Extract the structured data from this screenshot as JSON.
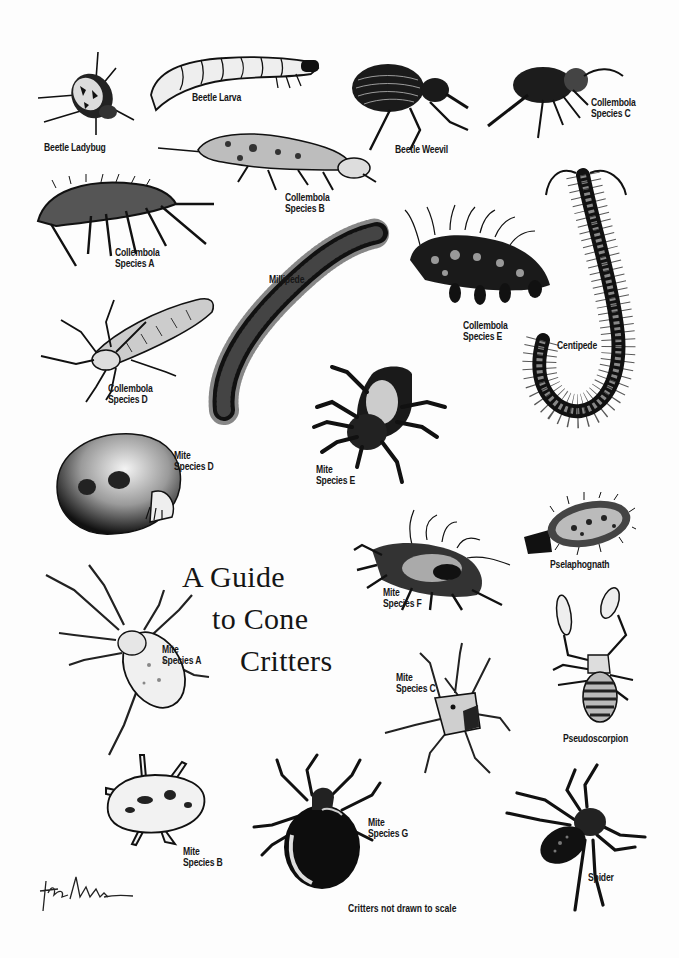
{
  "poster": {
    "title_lines": [
      "A Guide",
      "to Cone",
      "Critters"
    ],
    "footnote": "Critters not drawn to scale",
    "signature_icon": "artist-signature-icon",
    "colors": {
      "ink": "#111111",
      "paper": "#fdfdfd"
    }
  },
  "critters": [
    {
      "id": "beetle-ladybug",
      "label": [
        "Beetle Ladybug"
      ]
    },
    {
      "id": "beetle-larva",
      "label": [
        "Beetle Larva"
      ]
    },
    {
      "id": "beetle-weevil",
      "label": [
        "Beetle Weevil"
      ]
    },
    {
      "id": "collembola-c",
      "label": [
        "Collembola",
        "Species C"
      ]
    },
    {
      "id": "collembola-b",
      "label": [
        "Collembola",
        "Species B"
      ]
    },
    {
      "id": "collembola-a",
      "label": [
        "Collembola",
        "Species A"
      ]
    },
    {
      "id": "millipede",
      "label": [
        "Millipede"
      ]
    },
    {
      "id": "collembola-e",
      "label": [
        "Collembola",
        "Species E"
      ]
    },
    {
      "id": "centipede",
      "label": [
        "Centipede"
      ]
    },
    {
      "id": "collembola-d",
      "label": [
        "Collembola",
        "Species D"
      ]
    },
    {
      "id": "mite-e",
      "label": [
        "Mite",
        "Species E"
      ]
    },
    {
      "id": "mite-d",
      "label": [
        "Mite",
        "Species D"
      ]
    },
    {
      "id": "pselaphognath",
      "label": [
        "Pselaphognath"
      ]
    },
    {
      "id": "mite-f",
      "label": [
        "Mite",
        "Species F"
      ]
    },
    {
      "id": "mite-a",
      "label": [
        "Mite",
        "Species A"
      ]
    },
    {
      "id": "mite-c",
      "label": [
        "Mite",
        "Species C"
      ]
    },
    {
      "id": "pseudoscorpion",
      "label": [
        "Pseudoscorpion"
      ]
    },
    {
      "id": "mite-b",
      "label": [
        "Mite",
        "Species B"
      ]
    },
    {
      "id": "mite-g",
      "label": [
        "Mite",
        "Species G"
      ]
    },
    {
      "id": "spider",
      "label": [
        "Spider"
      ]
    }
  ]
}
